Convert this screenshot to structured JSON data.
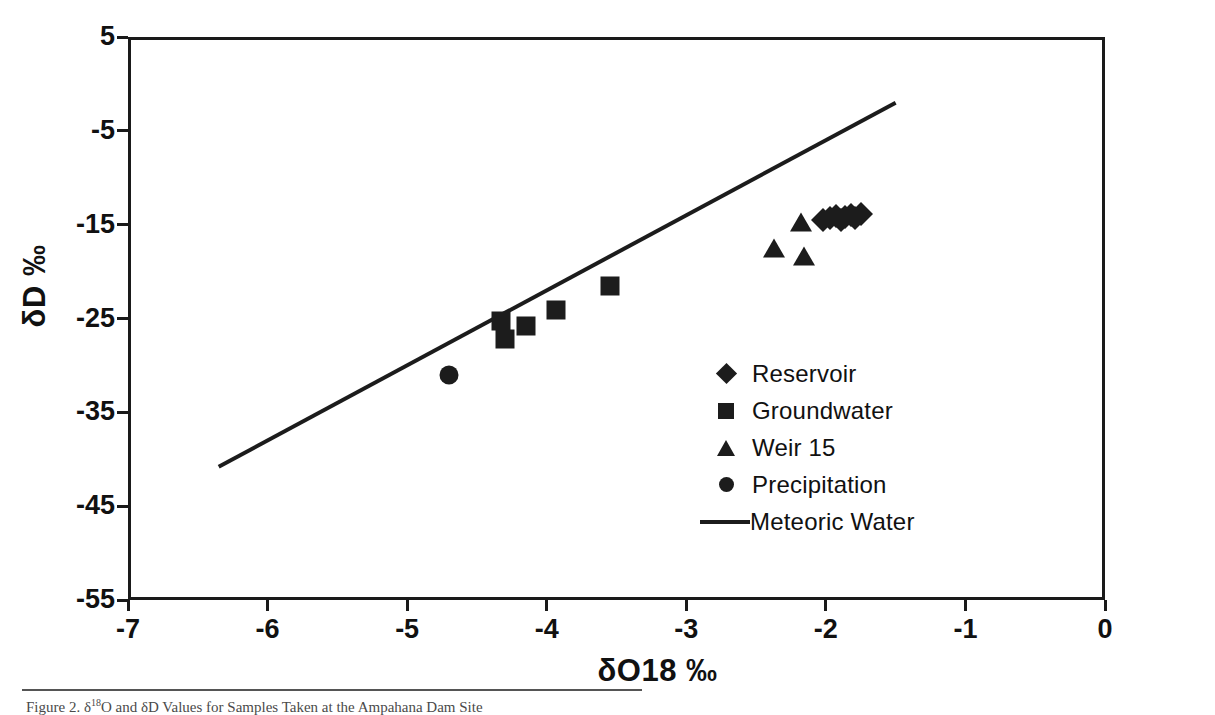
{
  "figure": {
    "caption_prefix": "Figure 2.",
    "caption_text": "O and δD Values for Samples Taken at the Ampahana Dam Site",
    "caption_delta": "δ",
    "caption_sup": "18"
  },
  "chart_data": {
    "type": "scatter",
    "title": "",
    "xlabel": "δO18 ‰",
    "ylabel": "δD ‰",
    "xlim": [
      -7,
      0
    ],
    "ylim": [
      -55,
      5
    ],
    "xticks": [
      -7,
      -6,
      -5,
      -4,
      -3,
      -2,
      -1,
      0
    ],
    "yticks": [
      5,
      -5,
      -15,
      -25,
      -35,
      -45,
      -55
    ],
    "xtick_labels": [
      "-7",
      "-6",
      "-5",
      "-4",
      "-3",
      "-2",
      "-1",
      "0"
    ],
    "ytick_labels": [
      "5",
      "-5",
      "-15",
      "-25",
      "-35",
      "-45",
      "-55"
    ],
    "grid": false,
    "legend_position": "center-right",
    "marker_color": "#1c1c1c",
    "line_color": "#1c1c1c",
    "series": [
      {
        "name": "Reservoir",
        "marker": "diamond",
        "points": [
          {
            "x": -2.02,
            "y": -14.55
          },
          {
            "x": -1.97,
            "y": -14.3
          },
          {
            "x": -1.93,
            "y": -14.1
          },
          {
            "x": -1.89,
            "y": -14.45
          },
          {
            "x": -1.86,
            "y": -14.15
          },
          {
            "x": -1.82,
            "y": -13.95
          },
          {
            "x": -1.79,
            "y": -14.25
          },
          {
            "x": -1.75,
            "y": -13.85
          }
        ]
      },
      {
        "name": "Groundwater",
        "marker": "square",
        "points": [
          {
            "x": -4.33,
            "y": -25.3
          },
          {
            "x": -4.3,
            "y": -27.2
          },
          {
            "x": -4.15,
            "y": -25.8
          },
          {
            "x": -3.93,
            "y": -24.1
          },
          {
            "x": -3.55,
            "y": -21.5
          }
        ]
      },
      {
        "name": "Weir 15",
        "marker": "triangle",
        "points": [
          {
            "x": -2.18,
            "y": -14.8
          },
          {
            "x": -2.37,
            "y": -17.6
          },
          {
            "x": -2.16,
            "y": -18.4
          }
        ]
      },
      {
        "name": "Precipitation",
        "marker": "circle",
        "points": [
          {
            "x": -4.7,
            "y": -31.0
          }
        ]
      },
      {
        "name": "Meteoric Water",
        "marker": "line",
        "line": {
          "slope": 8,
          "intercept": 10,
          "x_start": -6.35,
          "x_end": -1.5
        }
      }
    ],
    "legend": [
      {
        "label": "Reservoir",
        "marker": "diamond"
      },
      {
        "label": "Groundwater",
        "marker": "square"
      },
      {
        "label": "Weir 15",
        "marker": "triangle"
      },
      {
        "label": "Precipitation",
        "marker": "circle"
      },
      {
        "label": "Meteoric Water",
        "marker": "line"
      }
    ]
  }
}
